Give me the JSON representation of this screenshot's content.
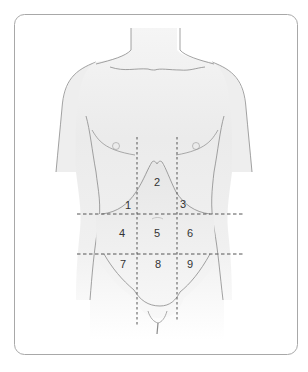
{
  "diagram": {
    "colors": {
      "frame_stroke": "#a8a8a8",
      "body_stroke": "#8a8a8a",
      "body_fill_top": "#ececec",
      "body_fill_bottom": "#ffffff",
      "abdomen_fill": "#e9e9e9",
      "dash_stroke": "#555555",
      "label": "#333333"
    },
    "regions": [
      {
        "id": 1,
        "label": "1"
      },
      {
        "id": 2,
        "label": "2"
      },
      {
        "id": 3,
        "label": "3"
      },
      {
        "id": 4,
        "label": "4"
      },
      {
        "id": 5,
        "label": "5"
      },
      {
        "id": 6,
        "label": "6"
      },
      {
        "id": 7,
        "label": "7"
      },
      {
        "id": 8,
        "label": "8"
      },
      {
        "id": 9,
        "label": "9"
      }
    ]
  }
}
